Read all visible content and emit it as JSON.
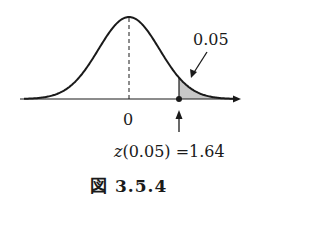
{
  "chart_data": {
    "type": "area",
    "title": "",
    "xlabel": "",
    "ylabel": "",
    "x_tick_labels": [
      "0"
    ],
    "distribution": "standard normal",
    "mean": 0,
    "shaded_region": {
      "from": 1.64,
      "to": "inf",
      "area": 0.05,
      "color": "#c8c8c8"
    },
    "annotations": [
      {
        "text": "0.05",
        "target": "shaded upper tail",
        "arrow": true
      },
      {
        "text": "z(0.05) = 1.64",
        "target": "cutoff point on axis",
        "arrow": true
      }
    ],
    "center_line": {
      "x": 0,
      "style": "dashed"
    },
    "grid": false,
    "legend": null
  },
  "labels": {
    "tail_area": "0.05",
    "center_tick": "0",
    "z_prefix": "z",
    "z_expression": "(0.05) =1.64",
    "caption": "図 3.5.4"
  },
  "colors": {
    "curve": "#1a1a1a",
    "shade": "#c8c8c8",
    "axis": "#1a1a1a"
  }
}
